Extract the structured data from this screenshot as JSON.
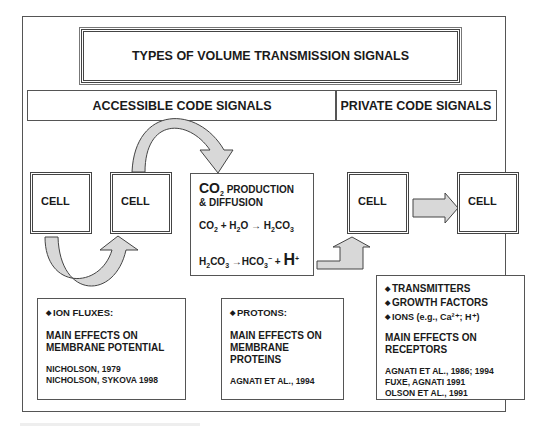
{
  "title": "TYPES OF VOLUME TRANSMISSION SIGNALS",
  "headers": {
    "accessible": "ACCESSIBLE CODE SIGNALS",
    "private": "PRIVATE CODE SIGNALS"
  },
  "cells": [
    "CELL",
    "CELL",
    "CELL",
    "CELL"
  ],
  "co2_box": {
    "title_prefix": "CO",
    "title_sub": "2",
    "title_rest": " PRODUCTION",
    "title_line2": "& DIFFUSION",
    "eq1": {
      "a": "CO",
      "a_sub": "2",
      "b": " + H",
      "b_sub": "2",
      "c": "O → H",
      "c_sub": "2",
      "d": "CO",
      "d_sub": "3"
    },
    "eq2": {
      "a": "H",
      "a_sub": "2",
      "b": "CO",
      "b_sub": "3",
      "c": " →HCO",
      "c_sub": "3",
      "c_sup": "−",
      "d": " + ",
      "big": "H",
      "big_sup": "+"
    }
  },
  "effects": [
    {
      "bullets": [
        "ION FLUXES:"
      ],
      "main": [
        "MAIN EFFECTS ON",
        "MEMBRANE POTENTIAL"
      ],
      "refs": [
        "NICHOLSON, 1979",
        "NICHOLSON, SYKOVA 1998"
      ]
    },
    {
      "bullets": [
        "PROTONS:"
      ],
      "main": [
        "MAIN EFFECTS ON",
        "MEMBRANE PROTEINS"
      ],
      "refs": [
        "AGNATI ET AL., 1994"
      ]
    },
    {
      "bullets": [
        "TRANSMITTERS",
        "GROWTH FACTORS",
        "IONS (e.g., Ca²⁺; H⁺)"
      ],
      "main": [
        "MAIN EFFECTS ON",
        "RECEPTORS"
      ],
      "refs": [
        "AGNATI ET AL., 1986; 1994",
        "FUXE, AGNATI 1991",
        "OLSON ET AL., 1991"
      ]
    }
  ],
  "bullet_glyph": "◆",
  "colors": {
    "arrow_fill": "#d8d8d8",
    "stroke": "#444444"
  }
}
